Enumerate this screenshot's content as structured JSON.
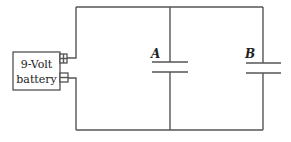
{
  "diagram": {
    "type": "circuit",
    "battery": {
      "label_line1": "9-Volt",
      "label_line2": "battery",
      "positive_terminal": "+",
      "negative_terminal": "-"
    },
    "capacitors": [
      {
        "id": "A",
        "label": "A"
      },
      {
        "id": "B",
        "label": "B"
      }
    ],
    "connection": "parallel",
    "colors": {
      "wire": "#555555",
      "text": "#222222",
      "background": "#ffffff"
    }
  }
}
